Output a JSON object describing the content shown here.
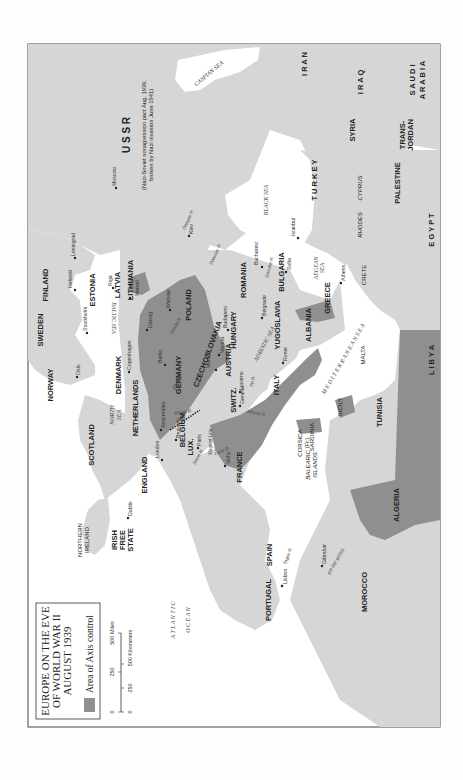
{
  "legend": {
    "title_line1": "EUROPE ON THE EVE",
    "title_line2": "OF WORLD WAR II",
    "title_line3": "AUGUST 1939",
    "axis_label": "Area of Axis control",
    "axis_color": "#8f8f8f"
  },
  "scale": {
    "miles": [
      "0",
      "250",
      "500 Miles"
    ],
    "km": [
      "0",
      "250",
      "500 Kilometers"
    ]
  },
  "colors": {
    "land": "#d6d6d6",
    "axis": "#8f8f8f",
    "water": "#ffffff",
    "border": "#555555"
  },
  "countries": {
    "ussr": "U S S R",
    "ussr_note1": "(Nazi-Soviet nonagression pact Aug. 1939,",
    "ussr_note2": "broken by Nazi invasion June 1941)",
    "finland": "FINLAND",
    "sweden": "SWEDEN",
    "norway": "NORWAY",
    "estonia": "ESTONIA",
    "latvia": "LATVIA",
    "lithuania": "LITHUANIA",
    "denmark": "DENMARK",
    "poland": "POLAND",
    "germany": "GERMANY",
    "czechoslovakia": "CZECHOSLOVAKIA",
    "austria": "AUSTRIA",
    "hungary": "HUNGARY",
    "romania": "ROMANIA",
    "bulgaria": "BULGARIA",
    "yugoslavia": "YUGOSLAVIA",
    "albania": "ALBANIA",
    "greece": "GREECE",
    "italy": "ITALY",
    "switz": "SWITZ.",
    "france": "FRANCE",
    "belgium": "BELGIUM",
    "lux": "LUX.",
    "netherlands": "NETHERLANDS",
    "england": "ENGLAND",
    "scotland": "SCOTLAND",
    "northern_ireland_1": "NORTHERN",
    "northern_ireland_2": "IRELAND",
    "irish_1": "IRISH",
    "irish_2": "FREE",
    "irish_3": "STATE",
    "spain": "SPAIN",
    "portugal": "PORTUGAL",
    "morocco": "MOROCCO",
    "algeria": "ALGERIA",
    "tunisia": "TUNISIA",
    "libya": "L I B Y A",
    "egypt": "E G Y P T",
    "palestine": "PALESTINE",
    "transjordan_1": "TRANS-",
    "transjordan_2": "JORDAN",
    "saudi_1": "S A U D I",
    "saudi_2": "A R A B I A",
    "syria": "SYRIA",
    "iraq": "I R A Q",
    "iran": "I R A N",
    "turkey": "T U R K E Y",
    "corsica": "CORSICA",
    "corsica_fr": "(Fr.)",
    "sardinia": "SARDINIA",
    "sicily": "SICILY",
    "malta": "MALTA",
    "crete": "CRETE",
    "rhodes": "RHODES",
    "cyprus": "CYPRUS",
    "balearic_1": "BALEARIC",
    "balearic_2": "ISLANDS"
  },
  "cities": {
    "moscow": "Moscow",
    "leningrad": "Leningrad",
    "helsinki": "Helsinki",
    "stockholm": "Stockholm",
    "oslo": "Oslo",
    "riga": "Riga",
    "memel": "Memel",
    "danzig": "Danzig",
    "warsaw": "Warsaw",
    "copenhagen": "Copenhagen",
    "berlin": "Berlin",
    "munich": "Munich",
    "vienna": "Vienna",
    "budapest": "Budapest",
    "bucharest": "Bucharest",
    "sofia": "Sofia",
    "belgrade": "Belgrade",
    "istanbul": "Istanbul",
    "athens": "Athens",
    "rome": "Rome",
    "locarno": "Locarno",
    "geneva": "Geneva",
    "paris": "Paris",
    "vichy": "Vichy",
    "brussels": "Brussels",
    "amsterdam": "Amsterdam",
    "london": "London",
    "dublin": "Dublin",
    "lisbon": "Lisbon",
    "gibraltar": "Gibraltar",
    "kiev": "Kiev"
  },
  "seas": {
    "caspian": "CASPIAN SEA",
    "black": "BLACK SEA",
    "baltic": "BALTIC SEA",
    "north_1": "NORTH",
    "north_2": "SEA",
    "adriatic": "ADRIATIC SEA",
    "aegean_1": "AEGEAN",
    "aegean_2": "SEA",
    "mediterranean": "M E D I T E R R A N E A N   S E A",
    "atlantic_1": "A T L A N T I C",
    "atlantic_2": "O C E A N"
  },
  "rivers": {
    "dnieper": "Dnieper R.",
    "dniester": "Dniester R.",
    "vistula": "Vistula R.",
    "elbe": "Elbe R.",
    "rhine": "Rhine R.",
    "danube": "Danube R.",
    "po": "Po R.",
    "rhone": "Rhone R.",
    "loire": "Loire R.",
    "seine": "Seine R.",
    "tagus": "Tagus R."
  },
  "other": {
    "maginot": "Maginot Line",
    "er_rif": "ER RIF MTNS."
  }
}
